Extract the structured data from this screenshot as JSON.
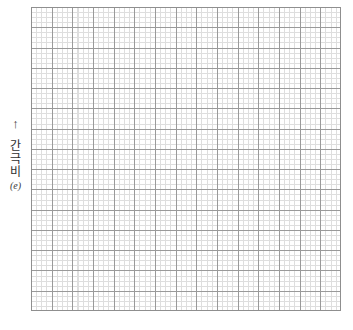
{
  "figure": {
    "kind": "blank-graph-paper",
    "background_color": "#ffffff"
  },
  "y_axis": {
    "arrow_glyph": "↑",
    "arrow_icon_name": "up-arrow-icon",
    "label_chars": [
      "간",
      "극",
      "비"
    ],
    "label_text": "간극비",
    "symbol": "(e)"
  },
  "grid": {
    "minor_color": "#dedede",
    "major_color": "#9a9a9a",
    "border_color": "#8f8f8f",
    "minor_spacing_px": 5,
    "major_spacing_px": 21,
    "major_divisions_x": 15,
    "major_divisions_y": 15,
    "plot_left_px": 31,
    "plot_top_px": 7,
    "plot_width_px": 310,
    "plot_height_px": 304
  },
  "chart_data": {
    "type": "line",
    "title": "",
    "subtitle": "",
    "xlabel": "",
    "ylabel": "간극비 (e)",
    "x": [],
    "series": [],
    "categories": [],
    "values": [],
    "tick_labels_x": [],
    "tick_labels_y": [],
    "legend": [],
    "legend_position": "none",
    "annotations": [],
    "grid": "major-and-minor",
    "note": "Blank graph paper: grid only, no plotted data, no numeric tick labels."
  }
}
